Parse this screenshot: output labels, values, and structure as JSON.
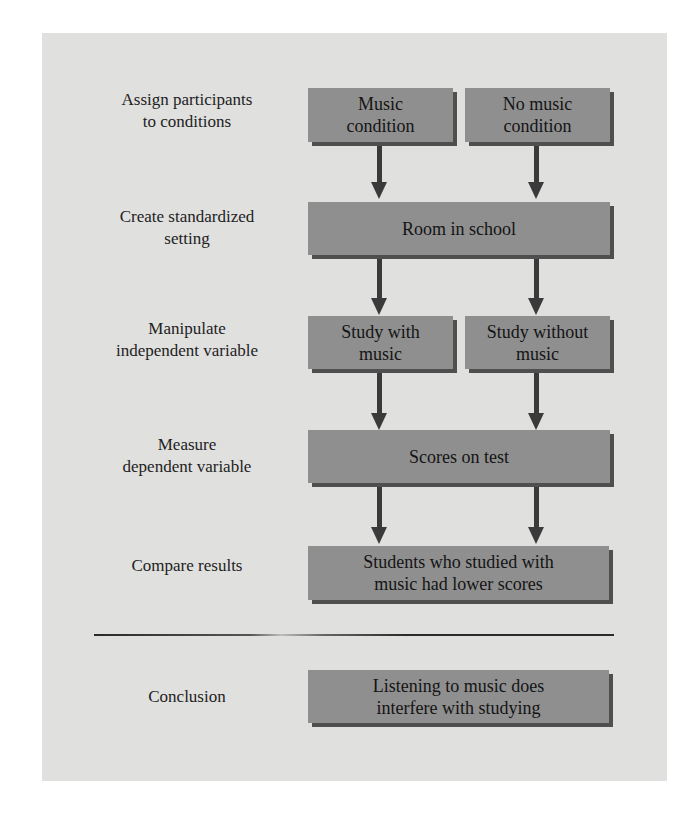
{
  "diagram": {
    "type": "flowchart",
    "colors": {
      "panel_background": "#e0e0df",
      "box_fill": "#8f8f8f",
      "box_shadow": "#4f4f4f",
      "arrow": "#3a3a3a",
      "text": "#1e1e1e"
    },
    "steps": [
      {
        "label_line1": "Assign participants",
        "label_line2": "to conditions",
        "boxes": [
          {
            "line1": "Music",
            "line2": "condition"
          },
          {
            "line1": "No music",
            "line2": "condition"
          }
        ]
      },
      {
        "label_line1": "Create standardized",
        "label_line2": "setting",
        "boxes": [
          {
            "line1": "Room in school"
          }
        ]
      },
      {
        "label_line1": "Manipulate",
        "label_line2": "independent variable",
        "boxes": [
          {
            "line1": "Study with",
            "line2": "music"
          },
          {
            "line1": "Study without",
            "line2": "music"
          }
        ]
      },
      {
        "label_line1": "Measure",
        "label_line2": "dependent variable",
        "boxes": [
          {
            "line1": "Scores on test"
          }
        ]
      },
      {
        "label_line1": "Compare results",
        "boxes": [
          {
            "line1": "Students who studied with",
            "line2": "music had lower scores"
          }
        ]
      }
    ],
    "conclusion": {
      "label": "Conclusion",
      "box": {
        "line1": "Listening to music does",
        "line2": "interfere with studying"
      }
    },
    "edges": [
      {
        "from": "Music condition",
        "to": "Room in school"
      },
      {
        "from": "No music condition",
        "to": "Room in school"
      },
      {
        "from": "Room in school",
        "to": "Study with music"
      },
      {
        "from": "Room in school",
        "to": "Study without music"
      },
      {
        "from": "Study with music",
        "to": "Scores on test"
      },
      {
        "from": "Study without music",
        "to": "Scores on test"
      },
      {
        "from": "Scores on test",
        "to": "Students who studied with music had lower scores"
      },
      {
        "from": "Scores on test",
        "to": "Students who studied with music had lower scores"
      }
    ]
  }
}
